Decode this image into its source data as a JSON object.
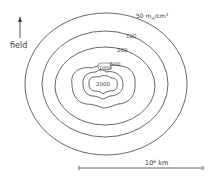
{
  "figure": {
    "field_label": "field",
    "scale_label_base": "10",
    "scale_label_exp": "6",
    "scale_label_unit": " km",
    "unit_label": "50 m",
    "unit_sub": "H",
    "unit_rest": "/cm",
    "unit_exp": "3"
  },
  "contours": [
    {
      "label": "50",
      "value": 50
    },
    {
      "label": "100",
      "value": 100
    },
    {
      "label": "200",
      "value": 200
    },
    {
      "label": "500",
      "value": 500
    },
    {
      "label": "1000",
      "value": 1000
    },
    {
      "label": "2000",
      "value": 2000
    }
  ],
  "colors": {
    "line": "#555555",
    "text": "#3a3a3a"
  }
}
